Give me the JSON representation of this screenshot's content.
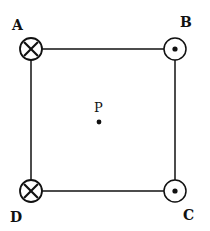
{
  "diagram": {
    "type": "square of current-carrying wires",
    "corners": [
      {
        "id": "A",
        "label": "A",
        "symbol": "into-page",
        "cx": 31,
        "cy": 49,
        "label_x": 12,
        "label_y": 30
      },
      {
        "id": "B",
        "label": "B",
        "symbol": "out-of-page",
        "cx": 175,
        "cy": 49,
        "label_x": 180,
        "label_y": 27
      },
      {
        "id": "C",
        "label": "C",
        "symbol": "out-of-page",
        "cx": 175,
        "cy": 191,
        "label_x": 183,
        "label_y": 220
      },
      {
        "id": "D",
        "label": "D",
        "symbol": "into-page",
        "cx": 31,
        "cy": 191,
        "label_x": 10,
        "label_y": 222
      }
    ],
    "point": {
      "label": "P",
      "cx": 99,
      "cy": 122,
      "label_x": 94,
      "label_y": 112
    },
    "colors": {
      "stroke": "#111111",
      "background": "#ffffff"
    }
  }
}
